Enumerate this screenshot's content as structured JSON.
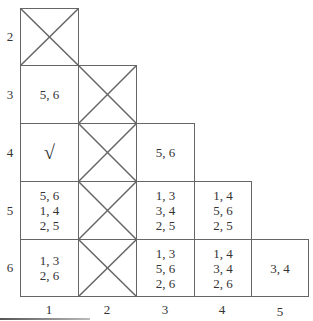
{
  "table": {
    "row_labels": [
      "2",
      "3",
      "4",
      "5",
      "6"
    ],
    "col_labels": [
      "1",
      "2",
      "3",
      "4",
      "5"
    ],
    "cells": {
      "r2c1": {
        "type": "crossed",
        "text": ""
      },
      "r3c1": {
        "type": "text",
        "text": "5, 6"
      },
      "r3c2": {
        "type": "crossed",
        "text": ""
      },
      "r4c1": {
        "type": "check",
        "text": "√"
      },
      "r4c2": {
        "type": "crossed",
        "text": ""
      },
      "r4c3": {
        "type": "text",
        "text": "5, 6"
      },
      "r5c1": {
        "type": "text",
        "text": "5, 6\n1, 4\n2, 5"
      },
      "r5c2": {
        "type": "crossed",
        "text": ""
      },
      "r5c3": {
        "type": "text",
        "text": "1, 3\n3, 4\n2, 5"
      },
      "r5c4": {
        "type": "text",
        "text": "1, 4\n5, 6\n2, 5"
      },
      "r6c1": {
        "type": "text",
        "text": "1, 3\n2, 6"
      },
      "r6c2": {
        "type": "crossed",
        "text": ""
      },
      "r6c3": {
        "type": "text",
        "text": "1, 3\n5, 6\n2, 6"
      },
      "r6c4": {
        "type": "text",
        "text": "1, 4\n3, 4\n2, 6"
      },
      "r6c5": {
        "type": "text",
        "text": "3, 4"
      }
    }
  }
}
